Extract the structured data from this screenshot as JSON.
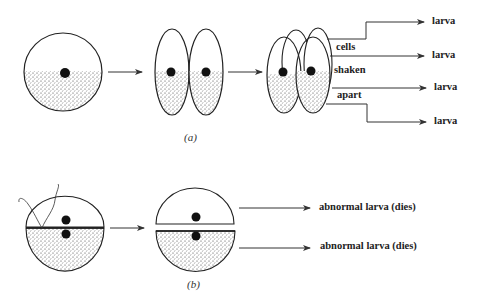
{
  "panel_a": {
    "caption": "(a)",
    "labels": {
      "cells": "cells",
      "shaken": "shaken",
      "apart": "apart"
    },
    "outcomes": [
      "larva",
      "larva",
      "larva",
      "larva"
    ]
  },
  "panel_b": {
    "caption": "(b)",
    "outcomes": [
      "abnormal larva (dies)",
      "abnormal larva (dies)"
    ]
  }
}
